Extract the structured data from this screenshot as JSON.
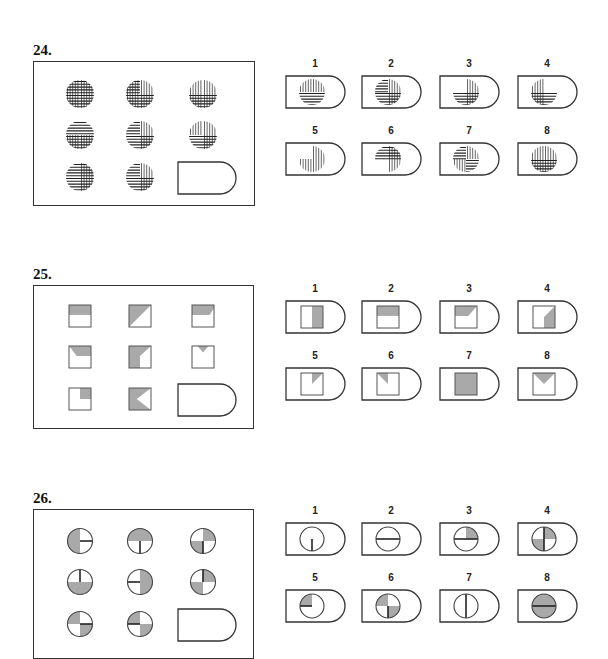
{
  "questions": [
    {
      "number": "24.",
      "type": "striped-circles",
      "matrix_cells": 8,
      "options": [
        "1",
        "2",
        "3",
        "4",
        "5",
        "6",
        "7",
        "8"
      ]
    },
    {
      "number": "25.",
      "type": "shaded-squares",
      "matrix_cells": 8,
      "options": [
        "1",
        "2",
        "3",
        "4",
        "5",
        "6",
        "7",
        "8"
      ]
    },
    {
      "number": "26.",
      "type": "quartered-circles",
      "matrix_cells": 8,
      "options": [
        "1",
        "2",
        "3",
        "4",
        "5",
        "6",
        "7",
        "8"
      ]
    }
  ],
  "colors": {
    "shade": "#a9a9a9",
    "line": "#222222",
    "border": "#333333"
  }
}
